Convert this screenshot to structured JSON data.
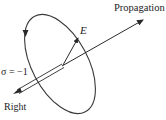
{
  "diagram": {
    "labels": {
      "propagation": "Propagation",
      "field": "E",
      "helicity": "σ = −1",
      "handedness": "Right"
    },
    "colors": {
      "stroke": "#2a2a2a",
      "ellipse": "#3a3a3a",
      "background": "#ffffff"
    }
  }
}
